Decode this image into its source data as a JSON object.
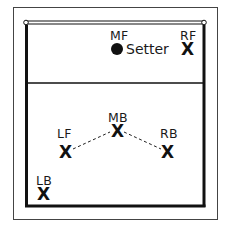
{
  "diagram": {
    "title": "",
    "net_position": "top",
    "colors": {
      "line": "#111111",
      "frame": "#444444",
      "background": "#ffffff"
    },
    "players": [
      {
        "id": "MF",
        "label": "MF",
        "marker": "dot",
        "role": "Setter"
      },
      {
        "id": "RF",
        "label": "RF",
        "marker": "X"
      },
      {
        "id": "MB",
        "label": "MB",
        "marker": "X"
      },
      {
        "id": "LF",
        "label": "LF",
        "marker": "X"
      },
      {
        "id": "RB",
        "label": "RB",
        "marker": "X"
      },
      {
        "id": "LB",
        "label": "LB",
        "marker": "X"
      }
    ],
    "connections": [
      {
        "from": "LF",
        "to": "MB",
        "style": "dashed"
      },
      {
        "from": "MB",
        "to": "RB",
        "style": "dashed"
      }
    ]
  }
}
